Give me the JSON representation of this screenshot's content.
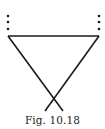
{
  "figure": {
    "caption": "Fig. 10.18",
    "line_color": "#1a1a1a"
  }
}
